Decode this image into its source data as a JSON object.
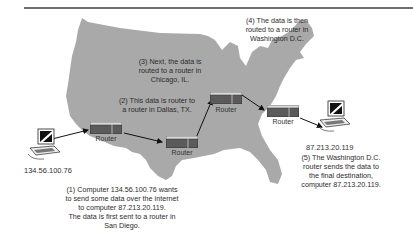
{
  "diagram": {
    "type": "network-routing-over-us-map",
    "colors": {
      "map_fill": "#a9a9a9",
      "rule": "#6e6e6e",
      "router_body": "#5b5b5b",
      "router_top": "#d8d8d8",
      "arrow": "#111111",
      "text": "#2b2b2b"
    },
    "steps": [
      {
        "id": 1,
        "text_lines": [
          "(1) Computer 134.56.100.76 wants",
          "to send some data over the internet",
          "to computer 87.213.20.119.",
          "The data is first sent to a router in",
          "San Diego."
        ]
      },
      {
        "id": 2,
        "text_lines": [
          "(2) This data is router to",
          "a router in Dallas, TX."
        ]
      },
      {
        "id": 3,
        "text_lines": [
          "(3) Next, the data is",
          "routed to a router in",
          "Chicago, IL."
        ]
      },
      {
        "id": 4,
        "text_lines": [
          "(4) The data is then",
          "routed to a router in",
          "Washington D.C."
        ]
      },
      {
        "id": 5,
        "text_lines": [
          "(5) The Washington D.C.",
          "router sends the data to",
          "the final destination,",
          "computer 87.213.20.119."
        ]
      }
    ],
    "nodes": {
      "source_computer": {
        "ip": "134.56.100.76"
      },
      "dest_computer": {
        "ip": "87.213.20.119"
      },
      "routers": [
        {
          "name": "San Diego",
          "label": "Router"
        },
        {
          "name": "Dallas",
          "label": "Router"
        },
        {
          "name": "Chicago",
          "label": "Router"
        },
        {
          "name": "Washington D.C.",
          "label": "Router"
        }
      ]
    }
  }
}
